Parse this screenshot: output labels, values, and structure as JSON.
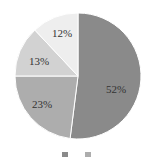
{
  "chart_data": {
    "type": "pie",
    "title": "",
    "categories": [
      "A",
      "B",
      "C",
      "D"
    ],
    "values": [
      52,
      23,
      13,
      12
    ],
    "labels": [
      "52%",
      "23%",
      "13%",
      "12%"
    ],
    "colors": [
      "#8a8a8a",
      "#adadad",
      "#d2d2d2",
      "#eeeeee"
    ],
    "start_angle": "12 o'clock, clockwise",
    "legend": {
      "position": "bottom",
      "entries": [
        "",
        ""
      ]
    }
  }
}
